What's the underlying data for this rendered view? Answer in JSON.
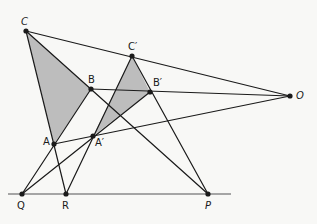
{
  "diagram": {
    "colors": {
      "background": "#f8f8f6",
      "line": "#1a1a1a",
      "baseline": "#8a8a8a",
      "shade": "#bdbdbd"
    },
    "points": {
      "C": {
        "label": "C",
        "x": 26,
        "y": 31
      },
      "B": {
        "label": "B",
        "x": 91,
        "y": 89
      },
      "A": {
        "label": "A",
        "x": 54,
        "y": 144
      },
      "C2": {
        "label": "C′",
        "x": 132,
        "y": 56
      },
      "B2": {
        "label": "B′",
        "x": 150,
        "y": 92
      },
      "A2": {
        "label": "A′",
        "x": 93,
        "y": 136
      },
      "O": {
        "label": "O",
        "x": 290,
        "y": 96
      },
      "Q": {
        "label": "Q",
        "x": 22,
        "y": 194
      },
      "R": {
        "label": "R",
        "x": 66,
        "y": 194
      },
      "P": {
        "label": "P",
        "x": 208,
        "y": 194
      }
    },
    "triangles": [
      {
        "name": "ABC",
        "vertices": [
          "A",
          "B",
          "C"
        ]
      },
      {
        "name": "A'B'C'",
        "vertices": [
          "A2",
          "B2",
          "C2"
        ]
      }
    ],
    "lines": [
      [
        "C",
        "O"
      ],
      [
        "B",
        "O"
      ],
      [
        "A",
        "O"
      ],
      [
        "C",
        "P"
      ],
      [
        "C2",
        "P"
      ],
      [
        "B",
        "Q"
      ],
      [
        "B2",
        "Q"
      ],
      [
        "C",
        "R"
      ],
      [
        "C2",
        "R"
      ]
    ],
    "baseline": {
      "x1": 8,
      "x2": 231,
      "y": 194
    }
  }
}
